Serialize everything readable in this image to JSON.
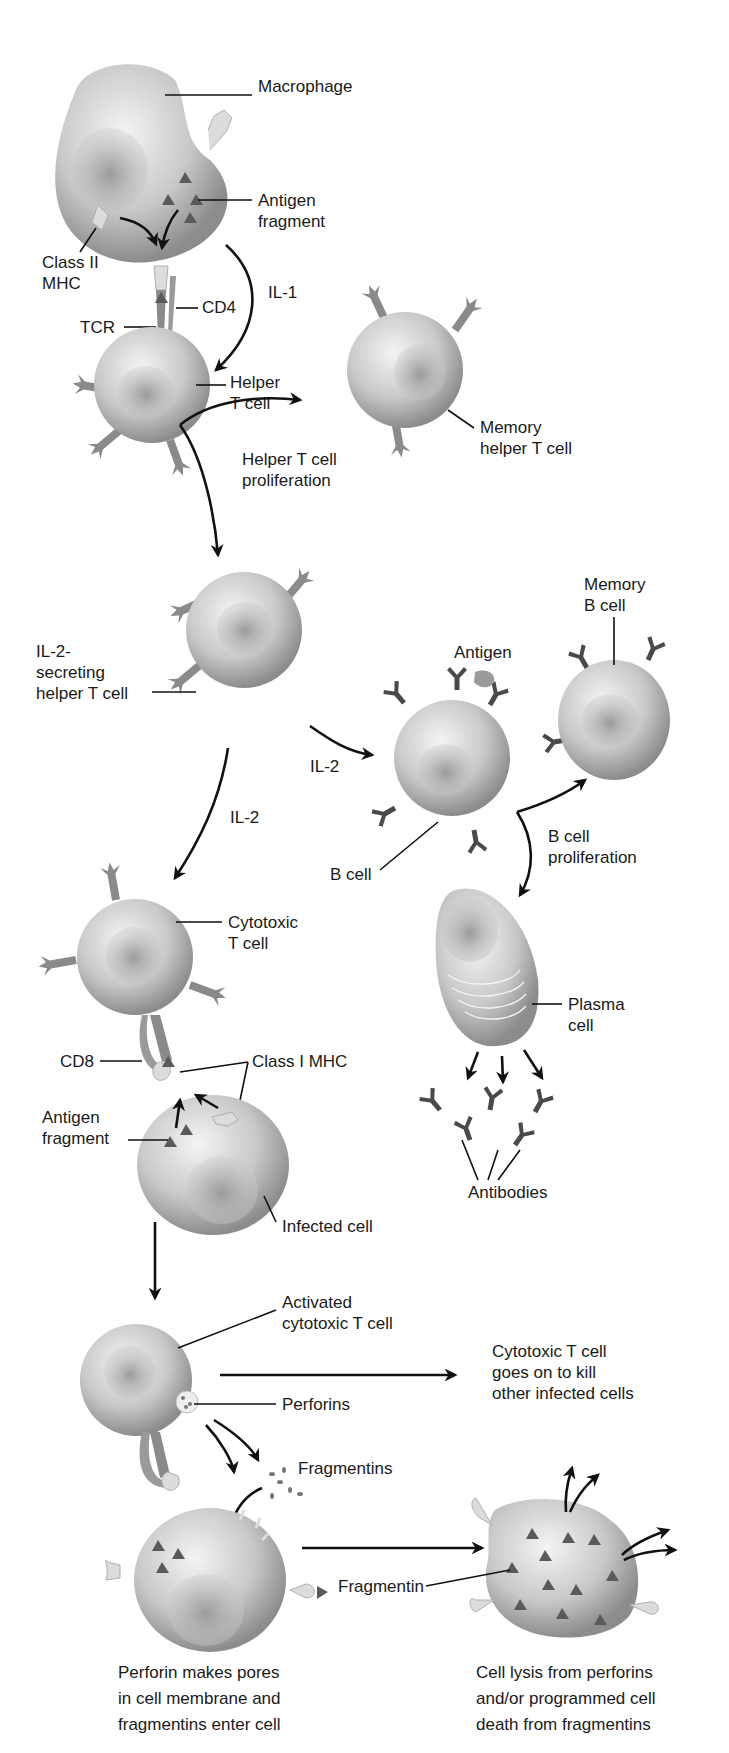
{
  "figure": {
    "colors": {
      "background": "#ffffff",
      "cell_light": "#e6e6e6",
      "cell_dark": "#8c8c8c",
      "receptor": "#8a8a8a",
      "antibody": "#4a4a4a",
      "arrow": "#111111",
      "text": "#1a1a1a"
    }
  },
  "labels": {
    "macrophage": "Macrophage",
    "antigen_fragment_1": [
      "Antigen",
      "fragment"
    ],
    "class_ii_mhc": [
      "Class II",
      "MHC"
    ],
    "il1": "IL-1",
    "cd4": "CD4",
    "tcr": "TCR",
    "helper_t": [
      "Helper",
      "T cell"
    ],
    "memory_helper_t": [
      "Memory",
      "helper T cell"
    ],
    "helper_prolif": [
      "Helper T cell",
      "proliferation"
    ],
    "il2_secreting": [
      "IL-2-",
      "secreting",
      "helper T cell"
    ],
    "il2_to_b": "IL-2",
    "il2_to_cyto": "IL-2",
    "antigen": "Antigen",
    "memory_b": [
      "Memory",
      "B cell"
    ],
    "b_cell": "B cell",
    "b_prolif": [
      "B cell",
      "proliferation"
    ],
    "cytotoxic_t": [
      "Cytotoxic",
      "T cell"
    ],
    "plasma_cell": [
      "Plasma",
      "cell"
    ],
    "cd8": "CD8",
    "class_i_mhc": "Class I MHC",
    "antigen_fragment_2": [
      "Antigen",
      "fragment"
    ],
    "antibodies": "Antibodies",
    "infected_cell": "Infected cell",
    "activated_cyto": [
      "Activated",
      "cytotoxic T cell"
    ],
    "kill_others": [
      "Cytotoxic T cell",
      "goes on to kill",
      "other infected cells"
    ],
    "perforins": "Perforins",
    "fragmentins": "Fragmentins",
    "fragmentin": "Fragmentin",
    "caption_left": [
      "Perforin makes pores",
      "in cell membrane and",
      "fragmentins enter cell"
    ],
    "caption_right": [
      "Cell lysis from perforins",
      "and/or programmed cell",
      "death from fragmentins"
    ]
  }
}
